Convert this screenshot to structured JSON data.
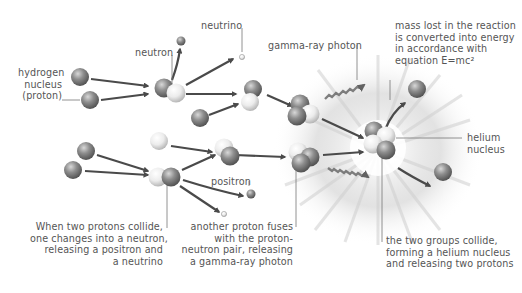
{
  "labels": {
    "neutrino": "neutrino",
    "neutron": "neutron",
    "hydrogen": [
      "hydrogen",
      "nucleus",
      "(proton)"
    ],
    "gamma": "gamma-ray photon",
    "mass": [
      "mass lost in the reaction",
      "is converted into energy",
      "in accordance with",
      "equation E=mc²"
    ],
    "helium": [
      "helium",
      "nucleus"
    ],
    "positron": "positron",
    "step1": [
      "When two protons collide,",
      "one changes into a neutron,",
      "releasing a positron and",
      "a neutrino"
    ],
    "step2": [
      "another proton fuses",
      "with the proton-",
      "neutron pair, releasing",
      "a gamma-ray photon"
    ],
    "step3": [
      "the two groups collide,",
      "forming a helium nucleus",
      "and releasing two protons"
    ]
  },
  "colors": {
    "proton": "#8a8a8a",
    "neutron": "#e6e6e6",
    "arrow": "#4a4a4a",
    "leader": "#777777",
    "text": "#555555"
  }
}
